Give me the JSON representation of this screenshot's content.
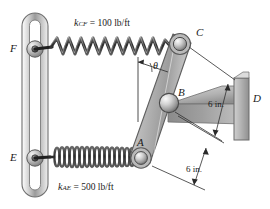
{
  "figure": {
    "background_color": "#ffffff",
    "ink_color": "#1a1a1a",
    "metal_color": "#a8a8a8"
  },
  "labels": {
    "point_F": "F",
    "point_E": "E",
    "point_C": "C",
    "point_B": "B",
    "point_A": "A",
    "point_D": "D",
    "angle": "θ"
  },
  "springs": [
    {
      "id": "spring-cf",
      "name": "upper-spring",
      "symbol": "k",
      "subscript": "CF",
      "equals": "=",
      "value": "100",
      "units": "lb/ft",
      "label_text": "k_CF = 100 lb/ft",
      "coil_count": 11,
      "style": "wide-zigzag"
    },
    {
      "id": "spring-ae",
      "name": "lower-spring",
      "symbol": "k",
      "subscript": "AE",
      "equals": "=",
      "value": "500",
      "units": "lb/ft",
      "label_text": "k_AE = 500 lb/ft",
      "coil_count": 22,
      "style": "tight-helix"
    }
  ],
  "dimensions": [
    {
      "id": "dim-upper",
      "value": "6",
      "units": "in.",
      "text": "6 in."
    },
    {
      "id": "dim-lower",
      "value": "6",
      "units": "in.",
      "text": "6 in."
    }
  ]
}
